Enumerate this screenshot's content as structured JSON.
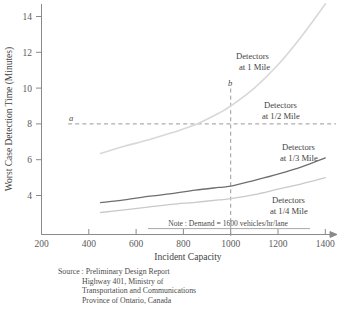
{
  "chart_data": {
    "type": "line",
    "title": "",
    "xlabel": "Incident Capacity",
    "ylabel": "Worst Case Detection Time (Minutes)",
    "xlim": [
      200,
      1440
    ],
    "ylim": [
      2.6,
      14.9
    ],
    "xticks": [
      200,
      400,
      600,
      800,
      1000,
      1200,
      1400
    ],
    "yticks": [
      4,
      6,
      8,
      10,
      12,
      14
    ],
    "grid": false,
    "legend_position": "inline-annotations",
    "series": [
      {
        "name": "Detectors at 1 Mile",
        "color": "#d8d8d8",
        "x": [
          450,
          550,
          650,
          750,
          850,
          950,
          1000,
          1100,
          1200,
          1300,
          1400
        ],
        "y": [
          6.35,
          6.75,
          7.1,
          7.5,
          7.95,
          8.6,
          9.0,
          10.0,
          11.3,
          12.9,
          14.7
        ]
      },
      {
        "name": "Detectors at 1/2 Mile",
        "color": "#cfcfcf",
        "x": [
          450,
          550,
          650,
          750,
          850,
          950,
          1000,
          1100,
          1200,
          1300,
          1400
        ],
        "y": [
          6.35,
          6.75,
          7.1,
          7.5,
          7.95,
          8.6,
          9.0,
          10.0,
          11.3,
          12.9,
          14.7
        ]
      },
      {
        "name": "Detectors at 1/3 Mile",
        "color": "#6e6e6e",
        "x": [
          450,
          550,
          650,
          750,
          850,
          950,
          1000,
          1100,
          1200,
          1300,
          1400
        ],
        "y": [
          3.6,
          3.75,
          3.95,
          4.1,
          4.3,
          4.45,
          4.52,
          4.85,
          5.2,
          5.6,
          6.1
        ]
      },
      {
        "name": "Detectors at 1/4 Mile",
        "color": "#c9c9c9",
        "x": [
          450,
          550,
          650,
          750,
          850,
          950,
          1000,
          1100,
          1200,
          1300,
          1400
        ],
        "y": [
          3.05,
          3.2,
          3.35,
          3.5,
          3.62,
          3.75,
          3.82,
          4.05,
          4.35,
          4.65,
          5.0
        ]
      }
    ],
    "annotations": [
      {
        "name": "marker-a",
        "text": "a",
        "x": 340,
        "y": 8.25,
        "style": "italic"
      },
      {
        "name": "marker-b",
        "text": "b",
        "x": 1000,
        "y": 10.45,
        "style": "italic"
      },
      {
        "name": "note",
        "text": "Note : Demand = 1600 vehicles/hr/lane"
      }
    ],
    "reference_lines": [
      {
        "name": "horizontal-reference-a",
        "orientation": "horizontal",
        "value": 8,
        "style": "dashed"
      },
      {
        "name": "vertical-reference-b",
        "orientation": "vertical",
        "value": 1000,
        "style": "dashed"
      }
    ]
  },
  "curve_labels": [
    {
      "line1": "Detectors",
      "line2": "at 1 Mile"
    },
    {
      "line1": "Detectors",
      "line2": "at 1/2 Mile"
    },
    {
      "line1": "Detectors",
      "line2": "at 1/3 Mile"
    },
    {
      "line1": "Detectors",
      "line2": "at 1/4 Mile"
    }
  ],
  "axis": {
    "x_title": "Incident Capacity",
    "y_title": "Worst Case Detection Time (Minutes)",
    "x_tick_labels": [
      "200",
      "400",
      "600",
      "800",
      "1000",
      "1200",
      "1400"
    ],
    "y_tick_labels": [
      "4",
      "6",
      "8",
      "10",
      "12",
      "14"
    ]
  },
  "note": {
    "text": "Note : Demand = 1600 vehicles/hr/lane"
  },
  "markers": {
    "a": "a",
    "b": "b"
  },
  "source": {
    "lines": [
      "Source : Preliminary Design Report",
      "Highway 401, Ministry of",
      "Transportation and Communications",
      "Province of Ontario, Canada"
    ]
  },
  "colors": {
    "axis": "#8a8a8a",
    "dash": "#9a9a9a",
    "dark_curve": "#6e6e6e",
    "light_curve": "#d4d4d4",
    "text": "#4a4a4a"
  }
}
